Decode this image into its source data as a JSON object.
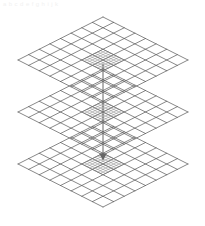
{
  "figure": {
    "caption_faint": "a b c d e f g h i j k",
    "background_color": "#ffffff",
    "canvas": {
      "width": 205,
      "height": 226
    }
  },
  "style": {
    "coarse_line_color": "#555555",
    "coarse_line_width": 0.7,
    "fine_line_color": "#777777",
    "fine_line_width": 0.45,
    "arrow_color": "#666666",
    "arrow_line_width": 1.0
  },
  "geometry": {
    "center_x": 103,
    "half_width": 85,
    "half_height": 43,
    "layer_centers_y": [
      60,
      112,
      164
    ],
    "coarse_divisions": 8,
    "refined_divisions": 8,
    "refined_region_cells": 2
  },
  "layers": [
    {
      "name": "top-layer",
      "label": "Level 0 grid",
      "center_y": 60,
      "apex_y": 17,
      "bottom_y": 103,
      "left_x": 18,
      "right_x": 188,
      "divisions": 8,
      "refined": false
    },
    {
      "name": "middle-layer",
      "label": "Level 1 grid",
      "center_y": 112,
      "apex_y": 69,
      "bottom_y": 155,
      "left_x": 18,
      "right_x": 188,
      "divisions": 8,
      "refined": true
    },
    {
      "name": "bottom-layer",
      "label": "Level 2 grid",
      "center_y": 164,
      "apex_y": 121,
      "bottom_y": 207,
      "left_x": 18,
      "right_x": 188,
      "divisions": 8,
      "refined": false
    }
  ],
  "refinement": {
    "name": "central-refined-patch",
    "label": "Refined sub-grid",
    "span_cells": 2,
    "sub_divisions": 8,
    "present_on_layers": [
      "top-layer",
      "middle-layer",
      "bottom-layer"
    ]
  },
  "arrow": {
    "name": "vertical-projection-arrow",
    "label": "Projection axis",
    "x": 103,
    "y_start": 64,
    "y_end": 160,
    "head_size": 4,
    "direction": "down"
  }
}
